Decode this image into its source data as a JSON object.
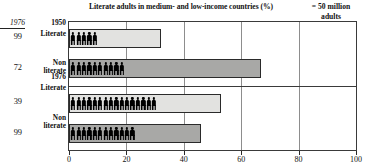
{
  "chart_data": {
    "type": "bar",
    "orientation": "horizontal",
    "title": "Literate adults in medium- and low-income countries (%)",
    "legend_note_line1": "= 50 million",
    "legend_note_line2": "adults",
    "xlabel": "",
    "ylabel": "",
    "xlim": [
      0,
      100
    ],
    "xticks": [
      0,
      20,
      40,
      60,
      80,
      100
    ],
    "xtick_labels": [
      "0",
      "20",
      "40",
      "60",
      "80",
      "100"
    ],
    "grid": true,
    "grid_axis": "x",
    "pictogram_unit": "50 million adults",
    "group_divider_after_index": 1,
    "side_column": {
      "header": "1976",
      "values": [
        "99",
        "72",
        "39",
        "99"
      ]
    },
    "categories": [
      {
        "group": "1950",
        "label_line1": "Literate",
        "label_line2": ""
      },
      {
        "group": "",
        "label_line1": "Non",
        "label_line2": "literate"
      },
      {
        "group": "1976",
        "label_line1": "Literate",
        "label_line2": ""
      },
      {
        "group": "",
        "label_line1": "Non",
        "label_line2": "literate"
      }
    ],
    "series": [
      {
        "name": "Literate / Non-literate adults",
        "values": [
          32,
          67,
          53,
          46
        ],
        "pictogram_counts": [
          5,
          10,
          16,
          12
        ],
        "colors": [
          "#e2e2e0",
          "#a8a8a6",
          "#e2e2e0",
          "#a8a8a6"
        ]
      }
    ],
    "colors": {
      "literate_fill": "#e2e2e0",
      "nonliterate_fill": "#a8a8a6",
      "bar_border": "#2a2a2a",
      "gridline": "#8d8d8d",
      "axis": "#3a3a3a",
      "figure": "#000000"
    }
  }
}
